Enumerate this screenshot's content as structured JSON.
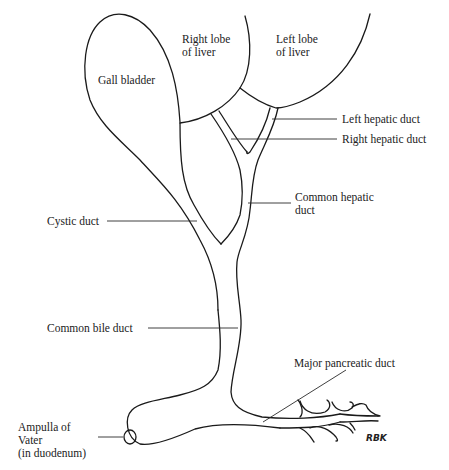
{
  "figure": {
    "type": "anatomical line drawing",
    "stroke_color": "#1a1a1a",
    "background": "#ffffff"
  },
  "structures": {
    "gall_bladder": "Gall bladder",
    "right_lobe_line1": "Right lobe",
    "right_lobe_line2": "of liver",
    "left_lobe_line1": "Left lobe",
    "left_lobe_line2": "of liver"
  },
  "callouts": {
    "left_hepatic_duct": "Left hepatic duct",
    "right_hepatic_duct": "Right hepatic duct",
    "common_hepatic_line1": "Common hepatic",
    "common_hepatic_line2": "duct",
    "cystic_duct": "Cystic duct",
    "common_bile_duct": "Common bile duct",
    "major_pancreatic_duct": "Major pancreatic duct",
    "ampulla_line1": "Ampulla of",
    "ampulla_line2": "Vater",
    "ampulla_line3": "(in duodenum)"
  },
  "signature": "RBK"
}
